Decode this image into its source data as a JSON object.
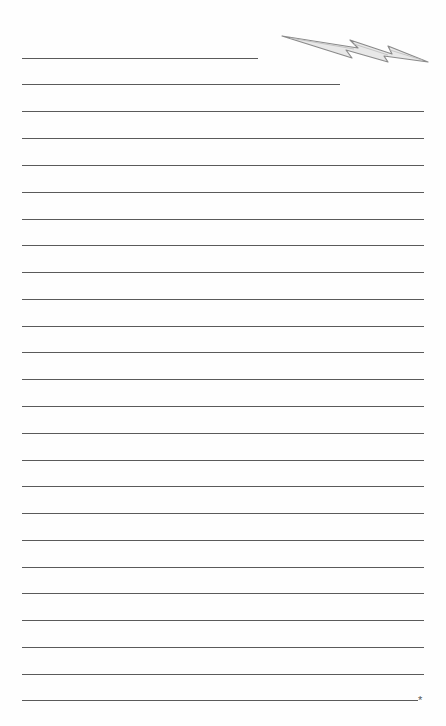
{
  "document": {
    "type": "lined-notepaper",
    "text": "",
    "line_color": "#5a5a5a",
    "decoration": "lightning-bolt-icon",
    "footer_mark": "*",
    "lines": [
      {
        "y": 58,
        "x1": 22,
        "x2": 258
      },
      {
        "y": 84,
        "x1": 22,
        "x2": 340
      },
      {
        "y": 111,
        "x1": 22,
        "x2": 424
      },
      {
        "y": 138,
        "x1": 22,
        "x2": 424
      },
      {
        "y": 165,
        "x1": 22,
        "x2": 424
      },
      {
        "y": 192,
        "x1": 22,
        "x2": 424
      },
      {
        "y": 219,
        "x1": 22,
        "x2": 424
      },
      {
        "y": 245,
        "x1": 22,
        "x2": 424
      },
      {
        "y": 272,
        "x1": 22,
        "x2": 424
      },
      {
        "y": 299,
        "x1": 22,
        "x2": 424
      },
      {
        "y": 326,
        "x1": 22,
        "x2": 424
      },
      {
        "y": 352,
        "x1": 22,
        "x2": 424
      },
      {
        "y": 379,
        "x1": 22,
        "x2": 424
      },
      {
        "y": 406,
        "x1": 22,
        "x2": 424
      },
      {
        "y": 433,
        "x1": 22,
        "x2": 424
      },
      {
        "y": 460,
        "x1": 22,
        "x2": 424
      },
      {
        "y": 486,
        "x1": 22,
        "x2": 424
      },
      {
        "y": 513,
        "x1": 22,
        "x2": 424
      },
      {
        "y": 540,
        "x1": 22,
        "x2": 424
      },
      {
        "y": 567,
        "x1": 22,
        "x2": 424
      },
      {
        "y": 593,
        "x1": 22,
        "x2": 424
      },
      {
        "y": 620,
        "x1": 22,
        "x2": 424
      },
      {
        "y": 647,
        "x1": 22,
        "x2": 424
      },
      {
        "y": 674,
        "x1": 22,
        "x2": 424
      },
      {
        "y": 700,
        "x1": 22,
        "x2": 418
      }
    ]
  }
}
